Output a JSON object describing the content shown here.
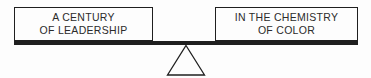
{
  "balance_diagram": {
    "left_box": {
      "line1": "A CENTURY",
      "line2": "OF LEADERSHIP"
    },
    "right_box": {
      "line1": "IN THE CHEMISTRY",
      "line2": "OF COLOR"
    },
    "colors": {
      "line_color": "#1f1f1f",
      "text_color": "#2b2b2b",
      "background": "#fdfdfd"
    }
  }
}
